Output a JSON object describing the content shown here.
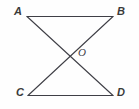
{
  "figure": {
    "type": "geometry-diagram",
    "background_color": "#fefefe",
    "stroke_color": "#3f3f46",
    "stroke_width": 1.1,
    "width": 139,
    "height": 109,
    "points": [
      {
        "id": "A",
        "label": "A",
        "x": 27,
        "y": 16.5
      },
      {
        "id": "B",
        "label": "B",
        "x": 113,
        "y": 16.5
      },
      {
        "id": "C",
        "label": "C",
        "x": 28,
        "y": 95.5
      },
      {
        "id": "D",
        "label": "D",
        "x": 113,
        "y": 95.5
      },
      {
        "id": "O",
        "label": "O",
        "x": 70.5,
        "y": 56.5
      }
    ],
    "segments": [
      {
        "id": "AB",
        "from": "A",
        "to": "B",
        "name": "segment-ab"
      },
      {
        "id": "CD",
        "from": "C",
        "to": "D",
        "name": "segment-cd"
      },
      {
        "id": "AD",
        "from": "A",
        "to": "D",
        "name": "segment-ad"
      },
      {
        "id": "BC",
        "from": "B",
        "to": "C",
        "name": "segment-bc"
      }
    ],
    "labels": {
      "A": "A",
      "B": "B",
      "C": "C",
      "D": "D",
      "O": "O"
    }
  }
}
